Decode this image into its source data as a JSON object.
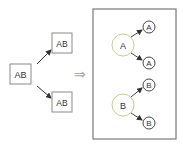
{
  "diagram": {
    "left": {
      "source_box": {
        "label": "AB"
      },
      "target_boxes": [
        {
          "label": "AB"
        },
        {
          "label": "AB"
        }
      ]
    },
    "implies_arrow": {
      "glyph": "⇒"
    },
    "right_panel": {
      "groups": [
        {
          "parent": {
            "label": "A"
          },
          "children": [
            {
              "label": "A"
            },
            {
              "label": "A"
            }
          ]
        },
        {
          "parent": {
            "label": "B"
          },
          "children": [
            {
              "label": "B"
            },
            {
              "label": "B"
            }
          ]
        }
      ]
    },
    "colors": {
      "box_stroke": "#8a8a8a",
      "frame_stroke": "#7a7a7a",
      "parent_circle_stroke": "#c8d08a",
      "child_circle_stroke": "#333333",
      "arrow": "#333333",
      "implies": "#aaaaaa"
    }
  }
}
